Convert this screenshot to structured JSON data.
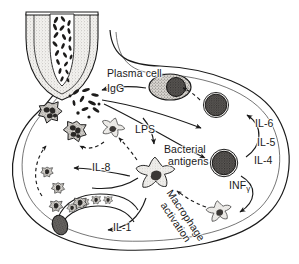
{
  "figure": {
    "width": 299,
    "height": 264,
    "background_color": "#ffffff",
    "ink_color": "#1a1a1a",
    "fill_light": "#e3e1dd",
    "fill_mid": "#b9b6b1",
    "fill_dark": "#555250"
  },
  "labels": {
    "plasma_cell": "Plasma cell",
    "igg": "IgG",
    "lps": "LPS",
    "bacterial_antigens_line1": "Bacterial",
    "bacterial_antigens_line2": "antigens",
    "il8": "IL-8",
    "il1": "IL-1",
    "il6": "IL-6",
    "il5": "IL-5",
    "il4": "IL-4",
    "inf_gamma_main": "INF",
    "inf_gamma_sub": "γ",
    "macrophage_activation_line1": "Macrophage",
    "macrophage_activation_line2": "activation"
  },
  "structures": {
    "crypt": "intestinal-crypt-with-bacteria",
    "lamina_propria": "lamina-propria-outline",
    "blood_vessel": "blood-vessel-with-marginating-leukocytes"
  },
  "cells": [
    {
      "name": "plasma-cell",
      "type": "plasma cell",
      "x": 170,
      "y": 87
    },
    {
      "name": "lymphocyte-upper",
      "type": "lymphocyte",
      "x": 216,
      "y": 105
    },
    {
      "name": "lymphocyte-lower",
      "type": "lymphocyte",
      "x": 224,
      "y": 163
    },
    {
      "name": "macrophage-central",
      "type": "macrophage",
      "x": 155,
      "y": 175
    },
    {
      "name": "macrophage-lower-right",
      "type": "macrophage",
      "x": 218,
      "y": 212
    },
    {
      "name": "macrophage-upper-mid",
      "type": "macrophage",
      "x": 112,
      "y": 130
    },
    {
      "name": "neutrophil-a",
      "type": "neutrophil",
      "x": 50,
      "y": 112
    },
    {
      "name": "neutrophil-b",
      "type": "neutrophil",
      "x": 74,
      "y": 131
    },
    {
      "name": "monocyte-a",
      "type": "monocyte",
      "x": 47,
      "y": 172
    },
    {
      "name": "monocyte-b",
      "type": "monocyte",
      "x": 57,
      "y": 187
    },
    {
      "name": "monocyte-c",
      "type": "monocyte",
      "x": 57,
      "y": 205
    },
    {
      "name": "monocyte-d",
      "type": "monocyte",
      "x": 80,
      "y": 203
    }
  ],
  "arrows": [
    {
      "name": "arrow-plasma-cell-to-igg",
      "style": "solid"
    },
    {
      "name": "arrow-lymphocyte-to-plasma-cell",
      "style": "dashed"
    },
    {
      "name": "arrow-antigen-to-lymphocyte-upper",
      "style": "solid"
    },
    {
      "name": "arrow-antigen-to-lymphocyte-lower",
      "style": "solid"
    },
    {
      "name": "arrow-cytokines-to-lymphocyte",
      "style": "solid"
    },
    {
      "name": "arrow-inf-gamma-to-macrophage",
      "style": "solid"
    },
    {
      "name": "arrow-macrophage-activation",
      "style": "dashed"
    },
    {
      "name": "arrow-lps-to-macrophage",
      "style": "solid"
    },
    {
      "name": "arrow-antigen-uptake",
      "style": "dashed"
    },
    {
      "name": "arrow-il8-to-neutrophils",
      "style": "solid"
    },
    {
      "name": "arrow-il1-to-vessel",
      "style": "solid"
    },
    {
      "name": "arrow-migration",
      "style": "dashed"
    }
  ]
}
